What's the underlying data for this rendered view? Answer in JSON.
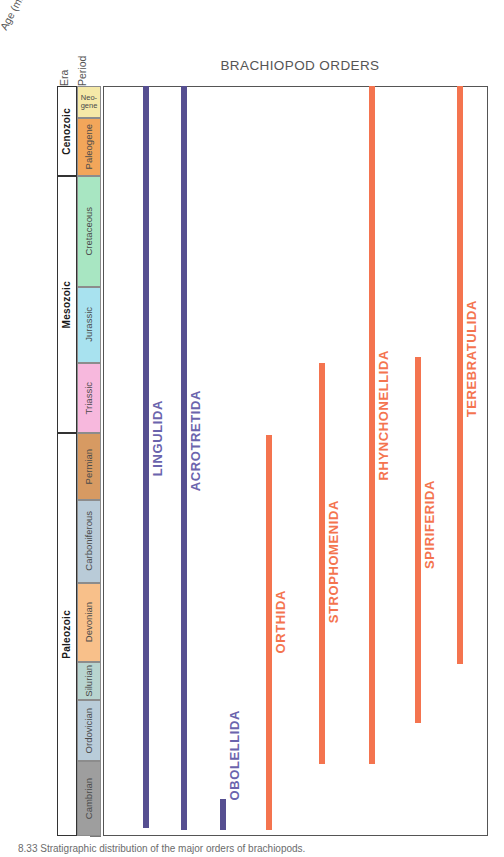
{
  "figure": {
    "title": "BRACHIOPOD ORDERS",
    "axis_title": "Age (m.y.)",
    "column_headers": {
      "era": "Era",
      "period": "Period"
    },
    "caption": "8.33  Stratigraphic distribution of the major orders of brachiopods."
  },
  "chart_data": {
    "type": "bar",
    "orientation": "vertical-range",
    "title": "BRACHIOPOD ORDERS",
    "xlabel": "",
    "ylabel": "Age (m.y.)",
    "ylim": [
      0,
      542
    ],
    "y_inverted": true,
    "grid": true,
    "legend": "none",
    "ticks": [
      0,
      50,
      100,
      150,
      200,
      250,
      300,
      350,
      400,
      450,
      500,
      542
    ],
    "tick_labels": [
      "0",
      "50",
      "100",
      "150",
      "200",
      "250",
      "300",
      "350",
      "400",
      "450",
      "500",
      "542"
    ],
    "eras": [
      {
        "name": "Cenozoic",
        "start": 0,
        "end": 65,
        "color": "#ffffff"
      },
      {
        "name": "Mesozoic",
        "start": 65,
        "end": 251,
        "color": "#ffffff"
      },
      {
        "name": "Paleozoic",
        "start": 251,
        "end": 542,
        "color": "#ffffff"
      }
    ],
    "periods": [
      {
        "name": "Neo-\ngene",
        "short": "Neogene",
        "start": 0,
        "end": 23,
        "color": "#f5e9a8"
      },
      {
        "name": "Paleogene",
        "short": "Paleogene",
        "start": 23,
        "end": 65,
        "color": "#f2a65a"
      },
      {
        "name": "Cretaceous",
        "short": "Cretaceous",
        "start": 65,
        "end": 145,
        "color": "#a8e6c2"
      },
      {
        "name": "Jurassic",
        "short": "Jurassic",
        "start": 145,
        "end": 200,
        "color": "#a8e2ef"
      },
      {
        "name": "Triassic",
        "short": "Triassic",
        "start": 200,
        "end": 251,
        "color": "#f7b8dd"
      },
      {
        "name": "Permian",
        "short": "Permian",
        "start": 251,
        "end": 299,
        "color": "#d79a62"
      },
      {
        "name": "Carboniferous",
        "short": "Carboniferous",
        "start": 299,
        "end": 359,
        "color": "#b9cbd8"
      },
      {
        "name": "Devonian",
        "short": "Devonian",
        "start": 359,
        "end": 416,
        "color": "#f8c08a"
      },
      {
        "name": "Silurian",
        "short": "Silurian",
        "start": 416,
        "end": 444,
        "color": "#b8d4cf"
      },
      {
        "name": "Ordovician",
        "short": "Ordovician",
        "start": 444,
        "end": 488,
        "color": "#b9ccd9"
      },
      {
        "name": "Cambrian",
        "short": "Cambrian",
        "start": 488,
        "end": 542,
        "color": "#9e9e9e"
      }
    ],
    "series": [
      {
        "name": "LINGULIDA",
        "start": 0,
        "end": 536,
        "color": "#564f91",
        "label_color": "#6b64ad",
        "x": 0.11
      },
      {
        "name": "ACROTRETIDA",
        "start": 0,
        "end": 538,
        "color": "#564f91",
        "label_color": "#6b64ad",
        "x": 0.21
      },
      {
        "name": "OBOLELLIDA",
        "start": 515,
        "end": 538,
        "color": "#564f91",
        "label_color": "#6b64ad",
        "x": 0.31
      },
      {
        "name": "ORTHIDA",
        "start": 252,
        "end": 538,
        "color": "#f4744f",
        "label_color": "#f4744f",
        "x": 0.43
      },
      {
        "name": "STROPHOMENIDA",
        "start": 200,
        "end": 490,
        "color": "#f4744f",
        "label_color": "#f4744f",
        "x": 0.57
      },
      {
        "name": "RHYNCHONELLIDA",
        "start": 0,
        "end": 490,
        "color": "#f4744f",
        "label_color": "#f4744f",
        "x": 0.7
      },
      {
        "name": "SPIRIFERIDA",
        "start": 196,
        "end": 460,
        "color": "#f4744f",
        "label_color": "#f4744f",
        "x": 0.82
      },
      {
        "name": "TEREBRATULIDA",
        "start": 0,
        "end": 418,
        "color": "#f4744f",
        "label_color": "#f4744f",
        "x": 0.93
      }
    ]
  }
}
